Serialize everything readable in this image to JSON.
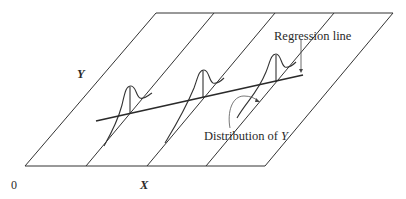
{
  "diagram": {
    "labels": {
      "y_axis": "Y",
      "x_axis": "X",
      "origin": "0",
      "regression_line": "Regression line",
      "distribution": "Distribution of Y",
      "distribution_of": "Distribution of ",
      "distribution_var": "Y"
    },
    "colors": {
      "line": "#333333",
      "background": "#ffffff"
    }
  }
}
